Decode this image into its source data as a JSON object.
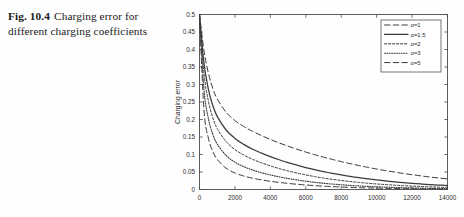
{
  "caption": {
    "figure_label": "Fig. 10.4",
    "text": "Charging error for different charging coefficients"
  },
  "chart_data": {
    "type": "line",
    "title": "",
    "xlabel": "",
    "ylabel": "Charging error",
    "xlim": [
      0,
      14000
    ],
    "ylim": [
      0,
      0.5
    ],
    "grid": false,
    "legend_position": "top-right",
    "xticks": [
      0,
      2000,
      4000,
      6000,
      8000,
      10000,
      12000,
      14000
    ],
    "xticklabels": [
      "0",
      "2000",
      "4000",
      "6000",
      "8000",
      "10000",
      "12000",
      "14000"
    ],
    "yticks": [
      0,
      0.05,
      0.1,
      0.15,
      0.2,
      0.25,
      0.3,
      0.35,
      0.4,
      0.45,
      0.5
    ],
    "yticklabels": [
      "0",
      "0.05",
      "0.1",
      "0.15",
      "0.2",
      "0.25",
      "0.3",
      "0.35",
      "0.4",
      "0.45",
      "0.5"
    ],
    "x": [
      0,
      250,
      500,
      750,
      1000,
      1500,
      2000,
      2500,
      3000,
      3500,
      4000,
      4500,
      5000,
      5500,
      6000,
      6500,
      7000,
      7500,
      8000,
      8500,
      9000,
      9500,
      10000,
      10500,
      11000,
      11500,
      12000,
      12500,
      13000,
      13500,
      14000
    ],
    "series": [
      {
        "name": "α=1",
        "label": "α=1",
        "style": "dashed",
        "color": "#3b3b3b",
        "values": [
          0.5,
          0.398,
          0.333,
          0.289,
          0.259,
          0.221,
          0.197,
          0.18,
          0.166,
          0.154,
          0.143,
          0.133,
          0.124,
          0.115,
          0.107,
          0.0995,
          0.0925,
          0.0859,
          0.0797,
          0.0739,
          0.0684,
          0.0633,
          0.0585,
          0.054,
          0.0498,
          0.0459,
          0.0423,
          0.0389,
          0.0357,
          0.0328,
          0.0301
        ]
      },
      {
        "name": "α=1.5",
        "label": "α=1.5",
        "style": "solid",
        "color": "#2f2f2f",
        "values": [
          0.5,
          0.362,
          0.287,
          0.24,
          0.209,
          0.17,
          0.146,
          0.129,
          0.115,
          0.104,
          0.0938,
          0.0849,
          0.0768,
          0.0694,
          0.0627,
          0.0566,
          0.0511,
          0.0461,
          0.0415,
          0.0374,
          0.0337,
          0.0303,
          0.0272,
          0.0244,
          0.0219,
          0.0197,
          0.0177,
          0.0158,
          0.0142,
          0.0127,
          0.0114
        ]
      },
      {
        "name": "α=2",
        "label": "α=2",
        "style": "finedash",
        "color": "#5a5a5a",
        "values": [
          0.5,
          0.333,
          0.253,
          0.205,
          0.174,
          0.137,
          0.114,
          0.0985,
          0.0862,
          0.0761,
          0.0675,
          0.0598,
          0.053,
          0.047,
          0.0417,
          0.0369,
          0.0327,
          0.029,
          0.0257,
          0.0227,
          0.0201,
          0.0178,
          0.0158,
          0.014,
          0.0124,
          0.011,
          0.0097,
          0.00859,
          0.00761,
          0.00674,
          0.00597
        ]
      },
      {
        "name": "α=3",
        "label": "α=3",
        "style": "dotted",
        "color": "#2a2a2a",
        "values": [
          0.5,
          0.287,
          0.203,
          0.158,
          0.13,
          0.0972,
          0.0781,
          0.0652,
          0.0556,
          0.0479,
          0.0416,
          0.0361,
          0.0314,
          0.0273,
          0.0237,
          0.0206,
          0.0179,
          0.0156,
          0.0135,
          0.0118,
          0.0102,
          0.00888,
          0.00772,
          0.00671,
          0.00583,
          0.00507,
          0.00441,
          0.00383,
          0.00333,
          0.00289,
          0.00252
        ]
      },
      {
        "name": "α=5",
        "label": "α=5",
        "style": "dashed",
        "color": "#6a6a6a",
        "values": [
          0.5,
          0.229,
          0.147,
          0.109,
          0.0862,
          0.061,
          0.0472,
          0.0384,
          0.0322,
          0.0274,
          0.0235,
          0.0202,
          0.0174,
          0.015,
          0.0129,
          0.0111,
          0.00955,
          0.00822,
          0.00707,
          0.00609,
          0.00524,
          0.00451,
          0.00388,
          0.00334,
          0.00288,
          0.00248,
          0.00213,
          0.00183,
          0.00158,
          0.00136,
          0.00117
        ]
      }
    ]
  }
}
